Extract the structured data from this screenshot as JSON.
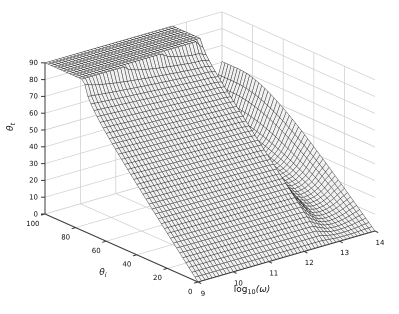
{
  "figure": {
    "background": "#ffffff",
    "width": 399,
    "height": 314
  },
  "chart_data": {
    "type": "surface",
    "title": "",
    "x_axis": {
      "label": "log10(ω)",
      "label_parts": {
        "base": "log",
        "sub": "10",
        "arg": "(ω)"
      },
      "range": [
        9,
        14
      ],
      "ticks": [
        9,
        10,
        11,
        12,
        13,
        14
      ]
    },
    "y_axis": {
      "label": "θi",
      "label_parts": {
        "base": "θ",
        "sub": "i"
      },
      "range": [
        0,
        100
      ],
      "ticks": [
        0,
        20,
        40,
        60,
        80,
        100
      ]
    },
    "z_axis": {
      "label": "θt",
      "label_parts": {
        "base": "θ",
        "sub": "t"
      },
      "range": [
        0,
        90
      ],
      "ticks": [
        0,
        10,
        20,
        30,
        40,
        50,
        60,
        70,
        80,
        90
      ]
    },
    "surface": {
      "formula": "theta_t(theta_i,u) = asin( min(1, sin(min(theta_i,90)deg) / n(u)) ) in degrees; saturates at 90 (total refraction plateau) where sin(theta_i) >= n(u)",
      "mesh_points_theta": 51,
      "mesh_points_omega": 51,
      "plateau_value": 90,
      "n_effective": {
        "u": [
          9.0,
          9.2,
          9.4,
          9.6,
          9.8,
          10.0,
          10.2,
          10.4,
          10.6,
          10.8,
          11.0,
          11.2,
          11.4,
          11.6,
          11.8,
          12.0,
          12.2,
          12.4,
          12.6,
          12.8,
          13.0,
          13.2,
          13.4,
          13.6,
          13.8,
          14.0
        ],
        "n": [
          0.962,
          0.9634,
          0.9648,
          0.9661,
          0.9675,
          0.9688,
          0.9702,
          0.9715,
          0.9729,
          0.9742,
          0.9756,
          0.977,
          0.9783,
          0.9797,
          0.981,
          0.9824,
          0.9837,
          0.984,
          0.988,
          1.3,
          1.8,
          2.0,
          1.9,
          1.65,
          1.35,
          1.15
        ]
      }
    },
    "legend": null,
    "grid": "on",
    "colors": {
      "face": "#f1f1f1",
      "mesh_edge": "#242424",
      "wall_grid": "#cccccc",
      "axis_line": "#3a3a3a",
      "tick_text": "#111111"
    }
  }
}
